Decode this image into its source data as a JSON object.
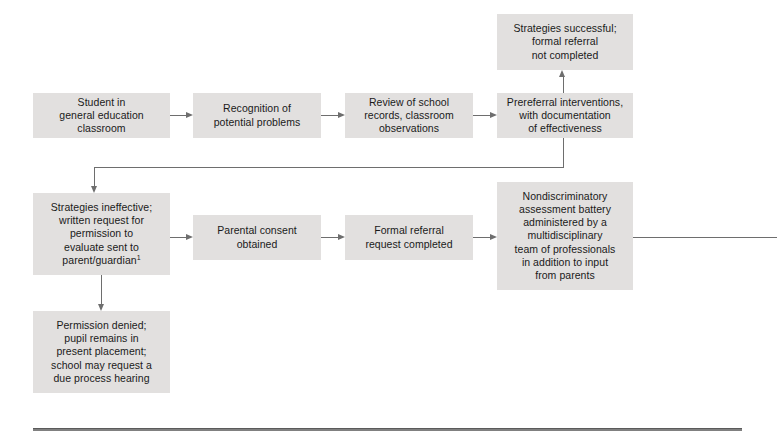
{
  "figure": {
    "type": "flowchart",
    "orientation": "left-to-right, wrapping",
    "box_fill": "#e2e0df",
    "connector_color": "#6e6e6e",
    "text_color": "#1a1a1a",
    "continues_offpage_right": true
  },
  "nodes": [
    {
      "id": "student",
      "label": "Student in\ngeneral education\nclassroom",
      "row": 1
    },
    {
      "id": "recognition",
      "label": "Recognition of\npotential problems",
      "row": 1
    },
    {
      "id": "review",
      "label": "Review of school\nrecords, classroom\nobservations",
      "row": 1
    },
    {
      "id": "prereferral",
      "label": "Prereferral interventions,\nwith documentation\nof effectiveness",
      "row": 1
    },
    {
      "id": "successful",
      "label": "Strategies successful;\nformal referral\nnot completed",
      "row": 0
    },
    {
      "id": "ineffective",
      "label": "Strategies ineffective;\nwritten request for\npermission to\nevaluate sent to\nparent/guardian",
      "footnote_marker": "1",
      "row": 2
    },
    {
      "id": "consent",
      "label": "Parental consent\nobtained",
      "row": 2
    },
    {
      "id": "formal-referral",
      "label": "Formal referral\nrequest completed",
      "row": 2
    },
    {
      "id": "assessment",
      "label": "Nondiscriminatory\nassessment battery\nadministered by a\nmultidisciplinary\nteam of professionals\nin addition to input\nfrom parents",
      "row": 2
    },
    {
      "id": "denied",
      "label": "Permission denied;\npupil remains in\npresent placement;\nschool may request a\ndue process hearing",
      "row": 3
    }
  ],
  "edges": [
    {
      "from": "student",
      "to": "recognition",
      "style": "arrow-right"
    },
    {
      "from": "recognition",
      "to": "review",
      "style": "arrow-right"
    },
    {
      "from": "review",
      "to": "prereferral",
      "style": "arrow-right"
    },
    {
      "from": "prereferral",
      "to": "successful",
      "style": "arrow-up"
    },
    {
      "from": "prereferral",
      "to": "ineffective",
      "style": "elbow-down-left-arrow-down"
    },
    {
      "from": "ineffective",
      "to": "consent",
      "style": "arrow-right"
    },
    {
      "from": "ineffective",
      "to": "denied",
      "style": "arrow-down"
    },
    {
      "from": "consent",
      "to": "formal-referral",
      "style": "arrow-right"
    },
    {
      "from": "formal-referral",
      "to": "assessment",
      "style": "arrow-right"
    },
    {
      "from": "assessment",
      "to": "offpage",
      "style": "line-right-continues"
    }
  ]
}
